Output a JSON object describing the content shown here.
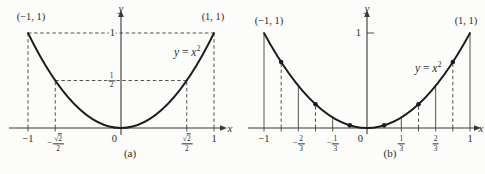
{
  "figure": {
    "background": "#fcfcfa",
    "ink": "#2e2e2e",
    "line_color": "#3f3f3f",
    "curve_color": "#1c1c1c"
  },
  "chart_data": [
    {
      "id": "a",
      "type": "line",
      "caption": "(a)",
      "title": "",
      "curve": {
        "expr": "y = x^2",
        "x_from": -1,
        "x_to": 1
      },
      "equation_label": {
        "lhs": "y",
        "eq": "=",
        "base": "x",
        "exp": "2"
      },
      "axis": {
        "x_label": "x",
        "y_label": "y",
        "origin_label": "0",
        "x_range": [
          -1,
          1
        ],
        "y_range": [
          0,
          1
        ],
        "grid": false
      },
      "corner_labels": [
        {
          "text": "(−1, 1)",
          "x": -1,
          "y": 1
        },
        {
          "text": "(1, 1)",
          "x": 1,
          "y": 1
        }
      ],
      "x_ticks": [
        {
          "v": -1,
          "text": "−1"
        },
        {
          "v": -0.70711,
          "frac": {
            "sign": "−",
            "sqrt": true,
            "num": "2",
            "den": "2"
          }
        },
        {
          "v": 0.70711,
          "frac": {
            "sqrt": true,
            "num": "2",
            "den": "2"
          }
        },
        {
          "v": 1,
          "text": "1"
        }
      ],
      "y_ticks": [
        {
          "v": 1,
          "text": "1"
        },
        {
          "v": 0.5,
          "frac": {
            "num": "1",
            "den": "2"
          }
        }
      ],
      "dashed_segments": [
        {
          "x1": -1,
          "y1": 0,
          "x2": -1,
          "y2": 1
        },
        {
          "x1": 1,
          "y1": 0,
          "x2": 1,
          "y2": 1
        },
        {
          "x1": -0.70711,
          "y1": 0,
          "x2": -0.70711,
          "y2": 0.5
        },
        {
          "x1": 0.70711,
          "y1": 0,
          "x2": 0.70711,
          "y2": 0.5
        },
        {
          "x1": -1,
          "y1": 1,
          "x2": 1,
          "y2": 1
        },
        {
          "x1": -0.70711,
          "y1": 0.5,
          "x2": 0.70711,
          "y2": 0.5
        }
      ],
      "solid_segments": [],
      "points": []
    },
    {
      "id": "b",
      "type": "line",
      "caption": "(b)",
      "title": "",
      "curve": {
        "expr": "y = x^2",
        "x_from": -1,
        "x_to": 1
      },
      "equation_label": {
        "lhs": "y",
        "eq": "=",
        "base": "x",
        "exp": "2"
      },
      "axis": {
        "x_label": "x",
        "y_label": "y",
        "origin_label": "0",
        "x_range": [
          -1,
          1
        ],
        "y_range": [
          0,
          1
        ],
        "grid": false
      },
      "corner_labels": [
        {
          "text": "(−1, 1)",
          "x": -1,
          "y": 1
        },
        {
          "text": "(1, 1)",
          "x": 1,
          "y": 1
        }
      ],
      "x_ticks": [
        {
          "v": -1,
          "text": "−1"
        },
        {
          "v": -0.66667,
          "frac": {
            "sign": "−",
            "num": "2",
            "den": "3"
          }
        },
        {
          "v": -0.33333,
          "frac": {
            "sign": "−",
            "num": "1",
            "den": "3"
          }
        },
        {
          "v": 0.33333,
          "frac": {
            "num": "1",
            "den": "3"
          }
        },
        {
          "v": 0.66667,
          "frac": {
            "num": "2",
            "den": "3"
          }
        },
        {
          "v": 1,
          "text": "1"
        }
      ],
      "y_ticks": [
        {
          "v": 1,
          "text": "1",
          "tick_mark": true
        }
      ],
      "minor_tick_xs": [
        -0.83333,
        -0.5,
        0.5,
        0.83333
      ],
      "dashed_segments": [
        {
          "x1": -0.83333,
          "y1": 0,
          "x2": -0.83333,
          "y2": 0.69444
        },
        {
          "x1": -0.5,
          "y1": 0,
          "x2": -0.5,
          "y2": 0.25
        },
        {
          "x1": 0.5,
          "y1": 0,
          "x2": 0.5,
          "y2": 0.25
        },
        {
          "x1": 0.83333,
          "y1": 0,
          "x2": 0.83333,
          "y2": 0.69444
        }
      ],
      "solid_segments": [
        {
          "x1": -1,
          "y1": 0,
          "x2": -1,
          "y2": 1
        },
        {
          "x1": -0.66667,
          "y1": 0,
          "x2": -0.66667,
          "y2": 0.44444
        },
        {
          "x1": -0.33333,
          "y1": 0,
          "x2": -0.33333,
          "y2": 0.11111
        },
        {
          "x1": 0.33333,
          "y1": 0,
          "x2": 0.33333,
          "y2": 0.11111
        },
        {
          "x1": 0.66667,
          "y1": 0,
          "x2": 0.66667,
          "y2": 0.44444
        },
        {
          "x1": 1,
          "y1": 0,
          "x2": 1,
          "y2": 1
        }
      ],
      "points": [
        {
          "x": -0.83333,
          "y": 0.69444
        },
        {
          "x": -0.5,
          "y": 0.25
        },
        {
          "x": -0.16667,
          "y": 0.02778
        },
        {
          "x": 0.16667,
          "y": 0.02778
        },
        {
          "x": 0.5,
          "y": 0.25
        },
        {
          "x": 0.83333,
          "y": 0.69444
        }
      ]
    }
  ]
}
